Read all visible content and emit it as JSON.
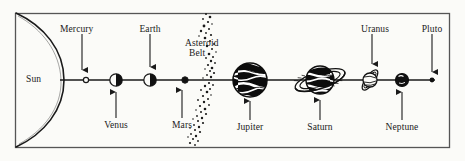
{
  "diagram": {
    "frame": {
      "x": 15,
      "y": 13,
      "width": 435,
      "height": 135
    },
    "axis": {
      "y": 80,
      "x_start": 60,
      "x_end": 435
    },
    "colors": {
      "ink": "#1a1a1a",
      "paper": "#fbfbf8",
      "frame": "#555555",
      "planet_fill": "#111111",
      "planet_light": "#ffffff"
    },
    "sun": {
      "label": "Sun",
      "label_x": 28,
      "label_y": 75,
      "description": "large partial disc arc at left edge"
    },
    "asteroid_belt": {
      "label_line1": "Asteroid",
      "label_line2": "Belt",
      "label_x": 186,
      "label_y": 39,
      "center_x": 200,
      "dot_count": 64
    },
    "bodies": [
      {
        "name": "Mercury",
        "x": 86,
        "radius": 2.6,
        "style": "dot",
        "label_side": "top",
        "label_x": 82,
        "label_y": 25,
        "arrow_from_y": 34,
        "arrow_to_y": 70
      },
      {
        "name": "Venus",
        "x": 116,
        "radius": 6.2,
        "style": "half",
        "label_side": "bottom",
        "label_x": 116,
        "label_y": 122,
        "arrow_from_y": 128,
        "arrow_to_y": 92
      },
      {
        "name": "Earth",
        "x": 150,
        "radius": 6.2,
        "style": "half",
        "label_side": "top",
        "label_x": 150,
        "label_y": 25,
        "arrow_from_y": 34,
        "arrow_to_y": 67
      },
      {
        "name": "Mars",
        "x": 185,
        "radius": 3.2,
        "style": "dot",
        "label_side": "bottom",
        "label_x": 182,
        "label_y": 122,
        "arrow_from_y": 128,
        "arrow_to_y": 90
      },
      {
        "name": "Jupiter",
        "x": 250,
        "radius": 17,
        "style": "banded",
        "label_side": "bottom",
        "label_x": 250,
        "label_y": 124,
        "arrow_from_y": 130,
        "arrow_to_y": 101
      },
      {
        "name": "Saturn",
        "x": 320,
        "radius": 14,
        "style": "ringed-big",
        "label_side": "bottom",
        "label_x": 320,
        "label_y": 124,
        "arrow_from_y": 130,
        "arrow_to_y": 101
      },
      {
        "name": "Uranus",
        "x": 370,
        "radius": 7.5,
        "style": "ringed-sm",
        "label_side": "top",
        "label_x": 372,
        "label_y": 25,
        "arrow_from_y": 34,
        "arrow_to_y": 64
      },
      {
        "name": "Neptune",
        "x": 402,
        "radius": 6.5,
        "style": "dark",
        "label_side": "bottom",
        "label_x": 402,
        "label_y": 124,
        "arrow_from_y": 130,
        "arrow_to_y": 92
      },
      {
        "name": "Pluto",
        "x": 432,
        "radius": 2.4,
        "style": "dot",
        "label_side": "top",
        "label_x": 432,
        "label_y": 25,
        "arrow_from_y": 34,
        "arrow_to_y": 72
      }
    ]
  }
}
